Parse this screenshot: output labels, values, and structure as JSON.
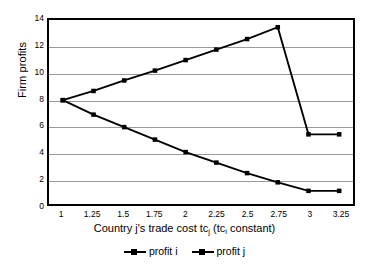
{
  "chart_data": {
    "type": "line",
    "title": "",
    "xlabel": "Country j's trade cost tcj  (tci constant)",
    "xlabel_parts": {
      "before": "Country j's trade cost tc",
      "sub1": "j",
      "middle": "  (tc",
      "sub2": "i",
      "after": " constant)"
    },
    "ylabel": "Firm profits",
    "categories": [
      "1",
      "1.25",
      "1.5",
      "1.75",
      "2",
      "2.25",
      "2.5",
      "2.75",
      "3",
      "3.25"
    ],
    "x": [
      1,
      1.25,
      1.5,
      1.75,
      2,
      2.25,
      2.5,
      2.75,
      3,
      3.25
    ],
    "ylim": [
      0,
      14
    ],
    "yticks": [
      0,
      2,
      4,
      6,
      8,
      10,
      12,
      14
    ],
    "ytick_labels": [
      "0",
      "2",
      "4",
      "6",
      "8",
      "10",
      "12",
      "14"
    ],
    "grid": "horizontal",
    "legend_position": "bottom",
    "series": [
      {
        "name": "profit i",
        "marker": "square",
        "color": "#000000",
        "values": [
          7.9,
          6.8,
          5.85,
          4.9,
          3.95,
          3.15,
          2.35,
          1.65,
          1.0,
          1.0
        ]
      },
      {
        "name": "profit j",
        "marker": "square",
        "color": "#000000",
        "values": [
          7.9,
          8.6,
          9.4,
          10.15,
          10.95,
          11.75,
          12.55,
          13.45,
          5.3,
          5.3
        ]
      }
    ]
  },
  "legend": {
    "entries": [
      {
        "label": "profit i"
      },
      {
        "label": "profit j"
      }
    ]
  }
}
